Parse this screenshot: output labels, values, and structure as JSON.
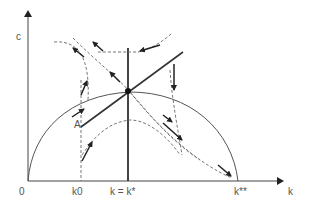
{
  "diagram": {
    "type": "phase diagram",
    "axes": {
      "y_label": "c",
      "x_label": "k",
      "origin_label": "0"
    },
    "x_ticks": [
      {
        "label": "k0",
        "x": 81
      },
      {
        "label": "k = k*",
        "x": 128
      },
      {
        "label": "k**",
        "x": 237
      }
    ],
    "point_labels": [
      {
        "label": "A",
        "x": 75,
        "y": 127
      }
    ],
    "colors": {
      "line": "#333333",
      "dashed": "#777777",
      "curve": "#555555"
    }
  }
}
